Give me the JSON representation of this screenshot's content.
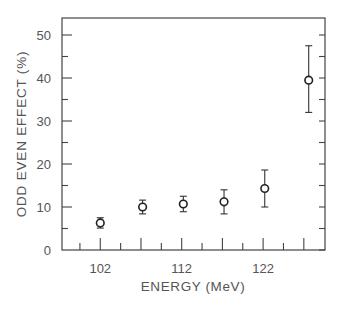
{
  "chart_data": {
    "type": "scatter",
    "title": "",
    "xlabel": "ENERGY (MeV)",
    "ylabel": "ODD EVEN EFFECT (%)",
    "xlim": [
      97.3,
      129.6
    ],
    "ylim": [
      0,
      50
    ],
    "x_tick_labels": [
      "102",
      "112",
      "122"
    ],
    "x_major_ticks": [
      102,
      107,
      112,
      117,
      122,
      127
    ],
    "x_minor_ticks": [
      99.5,
      104.5,
      109.5,
      114.5,
      119.5,
      124.5
    ],
    "y_tick_labels": [
      "0",
      "10",
      "20",
      "30",
      "40",
      "50"
    ],
    "y_major_ticks": [
      0,
      10,
      20,
      30,
      40,
      50
    ],
    "y_minor_ticks": [
      5,
      15,
      25,
      35,
      45
    ],
    "grid": false,
    "legend": null,
    "marker": "open-circle",
    "series": [
      {
        "name": "odd-even effect",
        "x": [
          102,
          107.2,
          112.2,
          117.2,
          122.2,
          127.6
        ],
        "y": [
          6.3,
          10.0,
          10.7,
          11.2,
          14.3,
          39.5
        ],
        "yerr_low": [
          1.2,
          1.6,
          1.8,
          2.8,
          4.3,
          7.5
        ],
        "yerr_high": [
          1.2,
          1.6,
          1.8,
          2.8,
          4.3,
          8.0
        ]
      }
    ]
  },
  "axes": {
    "x_title": "ENERGY (MeV)",
    "y_title": "ODD EVEN EFFECT (%)"
  }
}
